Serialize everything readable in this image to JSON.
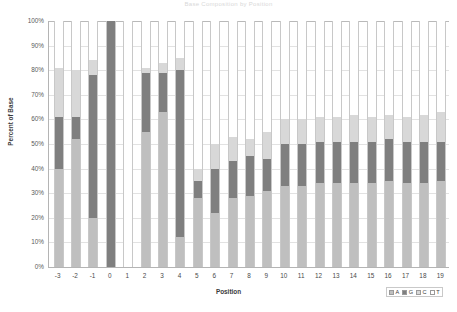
{
  "chart_data": {
    "type": "bar",
    "stacked": true,
    "stack_mode": "percent",
    "title": "Base Composition by Position",
    "xlabel": "Position",
    "ylabel": "Percent of Base",
    "ylim": [
      0,
      100
    ],
    "ytick_labels": [
      "0%",
      "10%",
      "20%",
      "30%",
      "40%",
      "50%",
      "60%",
      "70%",
      "80%",
      "90%",
      "100%"
    ],
    "ytick_values": [
      0,
      10,
      20,
      30,
      40,
      50,
      60,
      70,
      80,
      90,
      100
    ],
    "grid": true,
    "legend_position": "bottom-right",
    "categories": [
      "-3",
      "-2",
      "-1",
      "0",
      "1",
      "2",
      "3",
      "4",
      "5",
      "6",
      "7",
      "8",
      "9",
      "10",
      "11",
      "12",
      "13",
      "14",
      "15",
      "16",
      "17",
      "18",
      "19"
    ],
    "series": [
      {
        "name": "A",
        "color": "#bfbfbf",
        "values": [
          40,
          52,
          20,
          0,
          0,
          55,
          63,
          12,
          28,
          22,
          28,
          29,
          31,
          33,
          33,
          34,
          34,
          34,
          34,
          35,
          34,
          34,
          35
        ]
      },
      {
        "name": "G",
        "color": "#7f7f7f",
        "values": [
          21,
          9,
          58,
          100,
          0,
          24,
          16,
          68,
          7,
          18,
          15,
          16,
          13,
          17,
          17,
          17,
          17,
          17,
          17,
          17,
          17,
          17,
          16
        ]
      },
      {
        "name": "C",
        "color": "#d8d8d8",
        "values": [
          20,
          19,
          6,
          0,
          0,
          2,
          4,
          5,
          5,
          10,
          10,
          7,
          11,
          10,
          10,
          10,
          10,
          11,
          10,
          10,
          10,
          11,
          12
        ]
      },
      {
        "name": "T",
        "color": "#ffffff",
        "values": [
          19,
          20,
          16,
          0,
          100,
          19,
          17,
          15,
          60,
          50,
          47,
          48,
          45,
          40,
          40,
          39,
          39,
          38,
          39,
          38,
          39,
          38,
          37
        ]
      }
    ],
    "legend": [
      {
        "label": "A",
        "color": "#bfbfbf"
      },
      {
        "label": "G",
        "color": "#7f7f7f"
      },
      {
        "label": "C",
        "color": "#d8d8d8"
      },
      {
        "label": "T",
        "color": "#ffffff"
      }
    ]
  }
}
